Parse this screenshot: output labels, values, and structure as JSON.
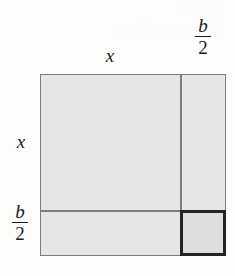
{
  "figure": {
    "background_color": "#fdfdfc",
    "fill_color": "#e6e6e6",
    "highlight_fill_color": "#dedede",
    "line_color": "#7c7c7c",
    "highlight_line_color": "#232323"
  },
  "labels": {
    "top_side": "x",
    "top_right_fraction": {
      "numerator": "b",
      "denominator": "2"
    },
    "left_side": "x",
    "left_bottom_fraction": {
      "numerator": "b",
      "denominator": "2"
    }
  },
  "regions": {
    "main_square": "x by x",
    "right_strip": "x by b/2",
    "bottom_strip": "b/2 by x",
    "corner_square": "b/2 by b/2"
  },
  "artifacts": {
    "ghost_line_1": "the equation",
    "ghost_line_2": "Solve"
  }
}
